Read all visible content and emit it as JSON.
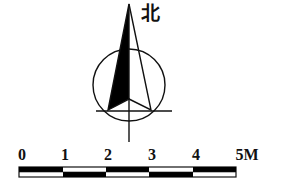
{
  "compass": {
    "north_label": "北",
    "colors": {
      "stroke": "#111111",
      "fill": "#000000"
    }
  },
  "scale_bar": {
    "ticks": [
      "0",
      "1",
      "2",
      "3",
      "4",
      "5M"
    ],
    "unit": "M",
    "segments": 5
  }
}
